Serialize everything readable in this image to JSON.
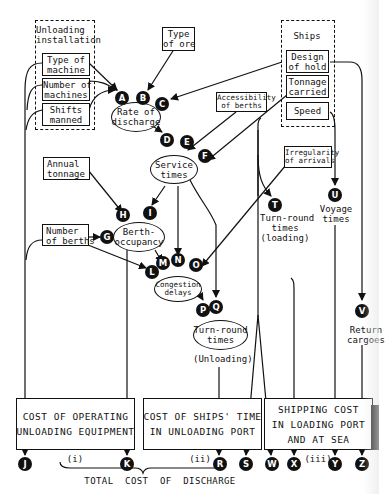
{
  "groups": {
    "unloading_installation": {
      "title": "Unloading\ninstallation",
      "items": [
        "Type of\nmachine",
        "Number of\nmachines",
        "Shifts\nmanned"
      ]
    },
    "ships": {
      "title": "Ships",
      "items": [
        "Design\nof hold",
        "Tonnage\ncarried",
        "Speed"
      ]
    }
  },
  "inputs": {
    "type_of_ore": "Type\nof ore",
    "accessibility_of_berths": "Accessibility\nof berths",
    "annual_tonnage": "Annual\ntonnage",
    "number_of_berths": "Number\nof berths",
    "irregularity_of_arrivals": "Irregularity\nof arrivals"
  },
  "ellipses": {
    "rate_of_discharge": "Rate of\ndischarge",
    "service_times": "Service\ntimes",
    "berth_occupancy": "Berth-\noccupancy",
    "congestion_delays": "Congestion\ndelays",
    "turn_round_unloading": "Turn-round\ntimes"
  },
  "labels": {
    "unloading_caption": "(Unloading)",
    "turn_round_loading": "Turn-round\ntimes\n(loading)",
    "voyage_times": "Voyage\ntimes",
    "return_cargoes": "Return\ncargoes"
  },
  "nodes": [
    "A",
    "B",
    "C",
    "D",
    "E",
    "F",
    "G",
    "H",
    "I",
    "J",
    "K",
    "L",
    "M",
    "N",
    "O",
    "P",
    "Q",
    "R",
    "S",
    "T",
    "U",
    "V",
    "W",
    "X",
    "Y",
    "Z"
  ],
  "costs": [
    {
      "text": "COST OF OPERATING\nUNLOADING EQUIPMENT",
      "numeral": "(i)"
    },
    {
      "text": "COST OF SHIPS' TIME\nIN UNLOADING PORT",
      "numeral": "(ii)"
    },
    {
      "text": "SHIPPING COST\nIN LOADING PORT\nAND AT SEA",
      "numeral": "(iii)"
    }
  ],
  "total_label": "TOTAL  COST  OF  DISCHARGE"
}
